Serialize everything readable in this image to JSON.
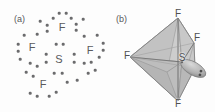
{
  "figure": {
    "background_color": "#fdfdfd",
    "ink_color": "#58585a",
    "dot_color": "#6b6b6d"
  },
  "panels": [
    {
      "id": "a",
      "label": "(a)",
      "type": "lewis-dot-structure",
      "description": "Lewis electron-dot structure of SF4",
      "center_atom": {
        "symbol": "S",
        "x": 59,
        "y": 59
      },
      "outer_atoms": [
        {
          "symbol": "F",
          "x": 62,
          "y": 27
        },
        {
          "symbol": "F",
          "x": 32,
          "y": 47
        },
        {
          "symbol": "F",
          "x": 90,
          "y": 50
        },
        {
          "symbol": "F",
          "x": 43,
          "y": 84
        }
      ],
      "electron_dots": [
        {
          "x": 59,
          "y": 13
        },
        {
          "x": 66,
          "y": 13
        },
        {
          "x": 47,
          "y": 25
        },
        {
          "x": 47,
          "y": 31
        },
        {
          "x": 76,
          "y": 24
        },
        {
          "x": 76,
          "y": 30
        },
        {
          "x": 40,
          "y": 21
        },
        {
          "x": 53,
          "y": 18
        },
        {
          "x": 83,
          "y": 19
        },
        {
          "x": 71,
          "y": 18
        },
        {
          "x": 18,
          "y": 44
        },
        {
          "x": 18,
          "y": 51
        },
        {
          "x": 24,
          "y": 35
        },
        {
          "x": 37,
          "y": 34
        },
        {
          "x": 103,
          "y": 43
        },
        {
          "x": 103,
          "y": 50
        },
        {
          "x": 97,
          "y": 35
        },
        {
          "x": 84,
          "y": 36
        },
        {
          "x": 56,
          "y": 44
        },
        {
          "x": 63,
          "y": 44
        },
        {
          "x": 46,
          "y": 54
        },
        {
          "x": 46,
          "y": 62
        },
        {
          "x": 74,
          "y": 54
        },
        {
          "x": 74,
          "y": 62
        },
        {
          "x": 54,
          "y": 73
        },
        {
          "x": 62,
          "y": 73
        },
        {
          "x": 30,
          "y": 63
        },
        {
          "x": 37,
          "y": 66
        },
        {
          "x": 26,
          "y": 72
        },
        {
          "x": 33,
          "y": 76
        },
        {
          "x": 84,
          "y": 63
        },
        {
          "x": 91,
          "y": 62
        },
        {
          "x": 95,
          "y": 70
        },
        {
          "x": 88,
          "y": 73
        },
        {
          "x": 30,
          "y": 93
        },
        {
          "x": 37,
          "y": 96
        },
        {
          "x": 56,
          "y": 92
        },
        {
          "x": 49,
          "y": 96
        },
        {
          "x": 67,
          "y": 82
        },
        {
          "x": 77,
          "y": 80
        },
        {
          "x": 20,
          "y": 59
        },
        {
          "x": 99,
          "y": 57
        }
      ]
    },
    {
      "id": "b",
      "label": "(b)",
      "type": "molecular-geometry",
      "description": "Trigonal bipyramidal electron geometry / see-saw shape of SF4 with one equatorial lone pair",
      "center_atom": {
        "symbol": "S",
        "x": 75,
        "y": 62
      },
      "vertices": [
        {
          "symbol": "F",
          "position": "axial-top",
          "x": 71,
          "y": 16
        },
        {
          "symbol": "F",
          "position": "equatorial-right",
          "x": 89,
          "y": 40
        },
        {
          "symbol": "F",
          "position": "equatorial-left",
          "x": 21,
          "y": 57
        },
        {
          "symbol": "F",
          "position": "axial-bottom",
          "x": 71,
          "y": 103
        }
      ],
      "lone_pair": {
        "label": "lone pair lobe",
        "dots": 2,
        "direction": "equatorial front-right"
      },
      "colors": {
        "face_light": "#d5d5d5",
        "face_mid": "#bfbfbf",
        "face_dark": "#a8a8a8",
        "edge": "#7d7d7d",
        "lobe": "#b3b3b3"
      }
    }
  ]
}
